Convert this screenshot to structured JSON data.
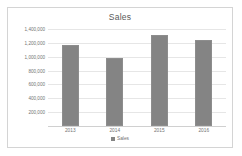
{
  "chart_data": {
    "type": "bar",
    "title": "Sales",
    "xlabel": "",
    "ylabel": "",
    "categories": [
      "2013",
      "2014",
      "2015",
      "2016"
    ],
    "values": [
      1170000,
      985000,
      1310000,
      1240000
    ],
    "series": [
      {
        "name": "Sales",
        "values": [
          1170000,
          985000,
          1310000,
          1240000
        ]
      }
    ],
    "ylim": [
      0,
      1400000
    ],
    "ytick_values": [
      1400000,
      1200000,
      1000000,
      800000,
      600000,
      400000,
      200000
    ],
    "ytick_labels": [
      "1,400,000",
      "1,200,000",
      "1,000,000",
      "800,000",
      "600,000",
      "400,000",
      "200,000"
    ],
    "grid": true,
    "legend": {
      "position": "bottom",
      "entries": [
        "Sales"
      ]
    },
    "colors": {
      "bar": "#848484",
      "bar_border": "#8d8d8d",
      "gridline": "#e6e6e6",
      "axis_line": "#d0d0d0",
      "title_text": "#5a5a5a",
      "tick_text": "#737373",
      "frame_border": "#d4d4d4",
      "background": "#ffffff"
    }
  }
}
